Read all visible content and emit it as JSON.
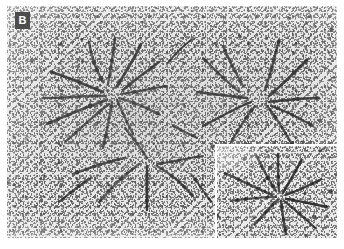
{
  "figure": {
    "panel_letter": "B",
    "kind": "electron-micrograph",
    "colors": {
      "plate_background": "#e8e8e8",
      "chromosome_fiber": "#2b2b2b",
      "grain_speckle": "#4a4a4a",
      "label_badge_background": "#4d4d4d",
      "label_badge_text": "#ffffff",
      "page_background": "#ffffff",
      "inset_border": "#ffffff"
    },
    "plate": {
      "x": 7,
      "y": 6,
      "width": 330,
      "height": 232
    },
    "label_badge": {
      "x": 15,
      "y": 12,
      "width": 15,
      "height": 17
    },
    "inset": {
      "x": 215,
      "y": 144,
      "width": 122,
      "height": 94,
      "border_width": 2,
      "content": "higher-magnification view of a single chromosome rosette"
    }
  },
  "chart_data": {
    "type": "scatter",
    "title": "",
    "xlabel": "",
    "ylabel": "",
    "main_view": {
      "rosettes": [
        {
          "name": "rosette-left",
          "center_x": 108,
          "center_y": 88,
          "arm_count": 9
        },
        {
          "name": "rosette-right",
          "center_x": 253,
          "center_y": 95,
          "arm_count": 8
        },
        {
          "name": "rosette-lower",
          "center_x": 140,
          "center_y": 170,
          "arm_count": 6
        }
      ],
      "fibers": [
        {
          "d": "M 82 36 C 84 50, 88 62, 96 76",
          "w": 2.6
        },
        {
          "d": "M 108 32 C 106 48, 104 62, 101 78",
          "w": 2.4
        },
        {
          "d": "M 134 38 C 128 52, 120 64, 110 80",
          "w": 2.8
        },
        {
          "d": "M 152 56 C 141 64, 128 74, 116 84",
          "w": 2.5
        },
        {
          "d": "M 44 66 C 58 70, 76 78, 96 86",
          "w": 2.7
        },
        {
          "d": "M 36 92 C 54 92, 74 90, 98 90",
          "w": 2.4
        },
        {
          "d": "M 40 118 C 58 110, 76 102, 100 94",
          "w": 2.6
        },
        {
          "d": "M 58 136 C 72 124, 86 110, 102 98",
          "w": 2.3
        },
        {
          "d": "M 96 142 C 100 126, 102 112, 105 96",
          "w": 2.5
        },
        {
          "d": "M 126 128 C 120 116, 114 104, 110 94",
          "w": 2.2
        },
        {
          "d": "M 152 108 C 140 102, 126 96, 112 92",
          "w": 2.4
        },
        {
          "d": "M 160 80 C 146 82, 130 86, 114 88",
          "w": 2.2
        },
        {
          "d": "M 216 40 C 222 54, 228 66, 236 80",
          "w": 2.4
        },
        {
          "d": "M 196 52 C 206 62, 218 74, 232 86",
          "w": 2.2
        },
        {
          "d": "M 190 86 C 206 88, 222 90, 240 92",
          "w": 2.5
        },
        {
          "d": "M 196 120 C 212 112, 228 102, 244 96",
          "w": 2.3
        },
        {
          "d": "M 224 136 C 232 122, 240 110, 248 100",
          "w": 2.2
        },
        {
          "d": "M 272 34 C 268 50, 264 66, 258 84",
          "w": 2.4
        },
        {
          "d": "M 300 54 C 288 66, 276 78, 262 90",
          "w": 2.5
        },
        {
          "d": "M 312 92 C 296 92, 280 94, 262 96",
          "w": 2.3
        },
        {
          "d": "M 306 120 C 292 112, 278 104, 264 100",
          "w": 2.2
        },
        {
          "d": "M 286 140 C 278 126, 270 112, 260 100",
          "w": 2.4
        },
        {
          "d": "M 66 168 C 82 162, 98 156, 118 152",
          "w": 2.6
        },
        {
          "d": "M 92 196 C 104 182, 118 168, 132 158",
          "w": 2.5
        },
        {
          "d": "M 140 204 C 140 188, 140 174, 140 160",
          "w": 2.4
        },
        {
          "d": "M 186 190 C 176 178, 164 168, 150 160",
          "w": 2.3
        },
        {
          "d": "M 196 150 C 180 152, 166 156, 150 158",
          "w": 2.2
        },
        {
          "d": "M 118 122 C 126 132, 134 142, 140 152",
          "w": 2.4
        },
        {
          "d": "M 52 196 C 64 186, 74 178, 84 172",
          "w": 2.2
        },
        {
          "d": "M 166 120 C 174 124, 182 128, 190 132",
          "w": 2.0
        },
        {
          "d": "M 160 58 C 168 48, 176 40, 184 34",
          "w": 2.0
        },
        {
          "d": "M 204 196 C 196 184, 190 176, 184 168",
          "w": 2.0
        }
      ]
    },
    "inset_view": {
      "rosette": {
        "name": "inset-rosette",
        "center_x": 64,
        "center_y": 52,
        "arm_count": 8
      },
      "fibers": [
        {
          "d": "M 40 10 C 46 22, 52 34, 60 46",
          "w": 2.6
        },
        {
          "d": "M 62 8 C 62 22, 62 34, 63 46",
          "w": 2.4
        },
        {
          "d": "M 86 14 C 80 26, 74 36, 67 48",
          "w": 2.6
        },
        {
          "d": "M 106 34 C 94 40, 82 46, 70 50",
          "w": 2.5
        },
        {
          "d": "M 112 62 C 98 60, 84 56, 70 54",
          "w": 2.4
        },
        {
          "d": "M 100 84 C 90 74, 78 64, 68 56",
          "w": 2.3
        },
        {
          "d": "M 70 90 C 68 78, 66 66, 65 56",
          "w": 2.5
        },
        {
          "d": "M 38 80 C 46 72, 54 62, 62 55",
          "w": 2.6
        },
        {
          "d": "M 14 56 C 30 54, 46 52, 60 52",
          "w": 2.4
        },
        {
          "d": "M 8 28 C 22 34, 38 42, 56 50",
          "w": 2.7
        }
      ]
    }
  }
}
